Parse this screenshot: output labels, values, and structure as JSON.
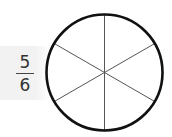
{
  "fraction": {
    "numerator": "5",
    "denominator": "6"
  },
  "circle": {
    "cx": 104.5,
    "cy": 72.5,
    "r": 58,
    "sections": 6,
    "stroke": "#111111"
  }
}
